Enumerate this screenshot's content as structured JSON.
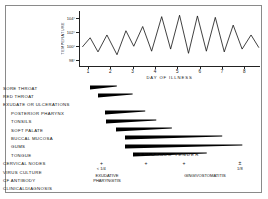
{
  "chart_data": {
    "type": "line",
    "title": "",
    "xlabel": "DAY OF ILLNESS",
    "ylabel": "TEMPERATURE",
    "xlim": [
      0.6,
      8.7
    ],
    "ylim": [
      97.2,
      105.0
    ],
    "xticklabels": [
      "1",
      "2",
      "3",
      "4",
      "5",
      "6",
      "7",
      "8"
    ],
    "xtickvalues": [
      1,
      2,
      3,
      4,
      5,
      6,
      7,
      8
    ],
    "yticklabels": [
      "104°",
      "102°",
      "100°",
      "98°"
    ],
    "ytickvalues": [
      104,
      102,
      100,
      98
    ],
    "grid": false,
    "legend": null,
    "series": [
      {
        "name": "Temperature",
        "x": [
          0.75,
          1.1,
          1.45,
          1.85,
          2.3,
          2.7,
          3.05,
          3.45,
          3.85,
          4.3,
          4.7,
          5.1,
          5.5,
          5.9,
          6.3,
          6.7,
          7.1,
          7.5,
          7.9,
          8.3,
          8.65
        ],
        "values": [
          99.9,
          101.2,
          99.2,
          101.6,
          98.8,
          102.2,
          100.0,
          102.8,
          99.3,
          104.2,
          99.6,
          104.4,
          99.0,
          104.3,
          99.3,
          104.1,
          99.2,
          103.0,
          99.6,
          101.6,
          99.8
        ]
      }
    ],
    "timeline": {
      "xlabel_unit": "day of illness",
      "bar_style": "tapered-wedge",
      "rows": [
        {
          "label": "SORE  THROAT",
          "indent": false,
          "start": 1.1,
          "end": 2.3,
          "has_bar": true
        },
        {
          "label": "RED THROAT",
          "indent": false,
          "start": 1.45,
          "end": 3.0,
          "has_bar": true
        },
        {
          "label": "EXUDATE  OR ULCERATIONS",
          "indent": false,
          "has_bar": false
        },
        {
          "label": "POSTERIOR  PHARYNX",
          "indent": true,
          "start": 1.75,
          "end": 3.55,
          "has_bar": true
        },
        {
          "label": "TONSILS",
          "indent": true,
          "start": 1.8,
          "end": 4.05,
          "has_bar": true
        },
        {
          "label": "SOFT  PALATE",
          "indent": true,
          "start": 2.25,
          "end": 4.75,
          "has_bar": true
        },
        {
          "label": "BUCCAL  MUCOSA",
          "indent": true,
          "start": 2.65,
          "end": 7.0,
          "has_bar": true
        },
        {
          "label": "GUMS",
          "indent": true,
          "start": 2.65,
          "end": 7.9,
          "has_bar": true
        },
        {
          "label": "TONGUE",
          "indent": true,
          "start": 3.0,
          "end": 6.3,
          "has_bar": true
        }
      ],
      "annotation_rows": [
        {
          "label": "CERVICAL  NODES",
          "text": "ENLARGED   TENDER"
        },
        {
          "label": "VIRUS  CULTURE",
          "marks": [
            "+",
            "+",
            "+",
            "±"
          ]
        },
        {
          "label": "CF ANTIBODY",
          "titers": [
            "< 1/4",
            "1/8"
          ]
        },
        {
          "label": "CLINICAL",
          "label2": "DIAGNOSIS",
          "diagnoses": [
            "EXUDATIVE PHARYNGITIS",
            "GINGIVOSTOMATITIS"
          ]
        }
      ]
    }
  },
  "axis": {
    "y_title": "TEMPERATURE",
    "x_title": "DAY OF ILLNESS"
  },
  "rows": {
    "sore_throat": "SORE  THROAT",
    "red_throat": "RED THROAT",
    "exudate": "EXUDATE  OR ULCERATIONS",
    "posterior_pharynx": "POSTERIOR  PHARYNX",
    "tonsils": "TONSILS",
    "soft_palate": "SOFT  PALATE",
    "buccal_mucosa": "BUCCAL  MUCOSA",
    "gums": "GUMS",
    "tongue": "TONGUE",
    "cervical_nodes": "CERVICAL  NODES",
    "virus_culture": "VIRUS  CULTURE",
    "cf_antibody": "CF ANTIBODY",
    "clinical": "CLINICAL",
    "diagnosis": "DIAGNOSIS"
  },
  "annotations": {
    "nodes_text": "ENLARGED   TENDER",
    "mark_1": "+",
    "mark_2": "+",
    "mark_3": "+",
    "mark_4": "±",
    "titer_left": "< 1/4",
    "titer_right": "1/8",
    "dx_left_1": "EXUDATIVE",
    "dx_left_2": "PHARYNGITIS",
    "dx_right_1": "GINGIVOSTOMATITIS"
  },
  "colors": {
    "ink": "#111111",
    "frame": "#8a8a8a",
    "bar": "#000000"
  }
}
